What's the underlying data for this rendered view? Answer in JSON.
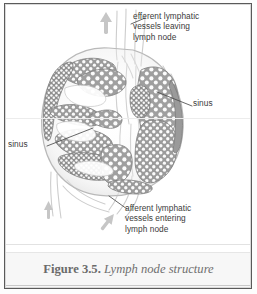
{
  "figure": {
    "caption_number": "Figure 3.5.",
    "caption_title": "Lymph node structure"
  },
  "labels": {
    "efferent": "efferent lymphatic\nvessels leaving\nlymph node",
    "afferent": "afferent lymphatic\nvessels entering\nlymph node",
    "sinus_right": "sinus",
    "sinus_left": "sinus"
  },
  "colors": {
    "ink": "#3b3b3b",
    "caption": "#6f6f6f",
    "border": "#5a5a5a",
    "cortex_dark": "#8d8d8d",
    "cortex_mid": "#b4b4b4",
    "vessel": "#c8c8c8",
    "arrow": "#c4c4c4",
    "page": "#ffffff"
  }
}
